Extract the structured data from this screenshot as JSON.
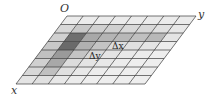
{
  "diagram": {
    "type": "oblique-grid",
    "rows": 8,
    "cols": 8,
    "geometry": {
      "top_left": [
        67,
        16
      ],
      "top_right": [
        196,
        16
      ],
      "bottom_left": [
        16,
        84
      ]
    },
    "line_color": "#3a3a3a",
    "labels": {
      "origin": {
        "text": "O",
        "x": 60,
        "y": 12
      },
      "y_axis": {
        "text": "y",
        "x": 198,
        "y": 18
      },
      "x_axis": {
        "text": "x",
        "x": 11,
        "y": 94
      },
      "delta_x": {
        "text": "Δx",
        "x": 112,
        "y": 49
      },
      "delta_y": {
        "text": "Δy",
        "x": 89,
        "y": 59
      }
    },
    "shades": [
      [
        "#ebebeb",
        "#ebebeb",
        "#ebebeb",
        "#ebebeb",
        "#ebebeb",
        "#ebebeb",
        "#ebebeb",
        "#ebebeb"
      ],
      [
        "#d8d8d8",
        "#c8c8c8",
        "#d0d0d0",
        "#d0d0d0",
        "#d8d8d8",
        "#d8d8d8",
        "#e0e0e0",
        "#e8e8e8"
      ],
      [
        "#d0d0d0",
        "#6e6e6e",
        "#a8a8a8",
        "#b4b4b4",
        "#b8b8b8",
        "#c0c0c0",
        "#b8b8b8",
        "#e4e4e4"
      ],
      [
        "#c8c8c8",
        "#6a6a6a",
        "#b0b0b0",
        "#c4c4c4",
        "#dcdcdc",
        "#e0e0e0",
        "#e4e4e4",
        "#ececec"
      ],
      [
        "#c0c0c0",
        "#9a9a9a",
        "#c4c4c4",
        "#d8d8d8",
        "#e4e4e4",
        "#e8e8e8",
        "#ececec",
        "#eeeeee"
      ],
      [
        "#d0d0d0",
        "#a8a8a8",
        "#dcdcdc",
        "#e4e4e4",
        "#e8e8e8",
        "#ececec",
        "#eeeeee",
        "#eeeeee"
      ],
      [
        "#d8d8d8",
        "#c0c0c0",
        "#e0e0e0",
        "#e8e8e8",
        "#ececec",
        "#eeeeee",
        "#eeeeee",
        "#eeeeee"
      ],
      [
        "#e4e4e4",
        "#e0e0e0",
        "#e8e8e8",
        "#ececec",
        "#eeeeee",
        "#eeeeee",
        "#eeeeee",
        "#eeeeee"
      ]
    ]
  }
}
